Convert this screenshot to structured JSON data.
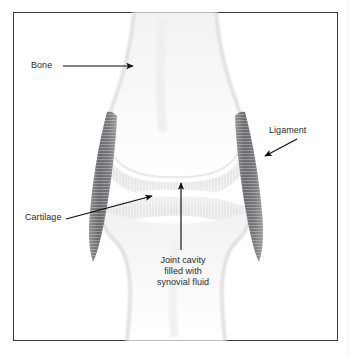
{
  "figure": {
    "border_color": "#3a3a3c",
    "background_color": "#ffffff"
  },
  "labels": {
    "bone": "Bone",
    "ligament": "Ligament",
    "cartilage": "Cartilage",
    "joint_cavity_line1": "Joint cavity",
    "joint_cavity_line2": "filled with",
    "joint_cavity_line3": "synovial fluid"
  },
  "colors": {
    "text": "#2b2b2b",
    "arrow": "#0d0d0d",
    "bone_fill": "#f4f4f4",
    "bone_edge": "#e2e2e2",
    "cartilage": "#ededed",
    "ligament_dark": "#6e6e72",
    "ligament_light": "#8d8d92",
    "border": "#3a3a3c"
  },
  "structures": [
    {
      "name": "upper-bone",
      "label_ref": "bone",
      "description": "Femur shaft widening into two rounded condyles"
    },
    {
      "name": "lower-bone",
      "label_ref": "bone",
      "description": "Tibia plateau narrowing into shaft"
    },
    {
      "name": "upper-cartilage",
      "label_ref": "cartilage",
      "description": "Light grey articular cartilage band on femoral condyles"
    },
    {
      "name": "lower-cartilage",
      "label_ref": "cartilage",
      "description": "Light grey articular cartilage band on tibial plateau"
    },
    {
      "name": "joint-cavity",
      "label_ref": "joint_cavity_line1",
      "description": "Gap between cartilage surfaces containing synovial fluid"
    },
    {
      "name": "ligament-left",
      "label_ref": "ligament",
      "description": "Dark striated collateral ligament spanning the joint on the left"
    },
    {
      "name": "ligament-right",
      "label_ref": "ligament",
      "description": "Dark striated collateral ligament spanning the joint on the right"
    }
  ],
  "annotations": [
    {
      "name": "bone-leader",
      "from": [
        63,
        66
      ],
      "to": [
        134,
        66
      ],
      "direction": "right"
    },
    {
      "name": "ligament-leader",
      "from": [
        297,
        139
      ],
      "to": [
        265,
        156
      ],
      "direction": "down-left"
    },
    {
      "name": "cartilage-leader",
      "from": [
        66,
        219
      ],
      "to": [
        152,
        196
      ],
      "direction": "up-right"
    },
    {
      "name": "joint-cavity-leader",
      "from": [
        181,
        250
      ],
      "to": [
        181,
        183
      ],
      "direction": "up"
    }
  ]
}
